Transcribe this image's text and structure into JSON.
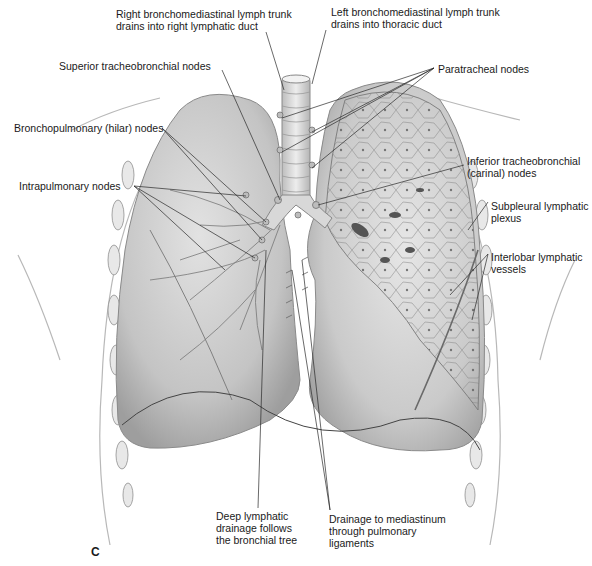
{
  "figure": {
    "panel_letter": "C"
  },
  "labels": {
    "right_trunk": "Right bronchomediastinal lymph trunk\ndrains into right lymphatic duct",
    "left_trunk": "Left bronchomediastinal lymph trunk\ndrains into thoracic duct",
    "superior_tb": "Superior tracheobronchial nodes",
    "paratracheal": "Paratracheal nodes",
    "hilar": "Bronchopulmonary (hilar) nodes",
    "inferior_tb": "Inferior tracheobronchial\n(carinal) nodes",
    "intrapulmonary": "Intrapulmonary nodes",
    "subpleural": "Subpleural lymphatic\nplexus",
    "interlobar": "Interlobar lymphatic\nvessels",
    "deep": "Deep lymphatic\ndrainage follows\nthe bronchial tree",
    "mediastinum": "Drainage to mediastinum\nthrough pulmonary\nligaments"
  },
  "colors": {
    "lung_fill": "#c9c9c9",
    "lung_shadow": "#9a9a9a",
    "outline": "#7a7a7a",
    "leader": "#2a2a2a",
    "text": "#1a1a1a"
  }
}
